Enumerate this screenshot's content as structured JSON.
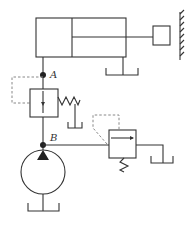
{
  "diagram": {
    "type": "hydraulic-circuit",
    "colors": {
      "line": "#333333",
      "pilot": "#888888",
      "background": "#ffffff"
    },
    "nodes": [
      {
        "id": "A",
        "label": "A"
      },
      {
        "id": "B",
        "label": "B"
      }
    ],
    "components": [
      {
        "id": "cylinder",
        "name": "Single-rod hydraulic cylinder"
      },
      {
        "id": "load",
        "name": "Load block"
      },
      {
        "id": "wall",
        "name": "Fixed wall"
      },
      {
        "id": "sequence-valve",
        "name": "Pressure valve with pilot line (between A and B)"
      },
      {
        "id": "relief-valve",
        "name": "Relief valve"
      },
      {
        "id": "pump",
        "name": "Fixed displacement pump"
      },
      {
        "id": "tanks",
        "name": "Tank / reservoir",
        "count": 4
      }
    ]
  }
}
